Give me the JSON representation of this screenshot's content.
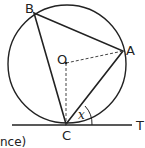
{
  "diagram": {
    "type": "circle-geometry",
    "points": {
      "B": {
        "label": "B"
      },
      "A": {
        "label": "A"
      },
      "C": {
        "label": "C"
      },
      "O": {
        "label": "O"
      },
      "T": {
        "label": "T"
      }
    },
    "angle_label": "x",
    "caption_fragment": "nce)"
  }
}
